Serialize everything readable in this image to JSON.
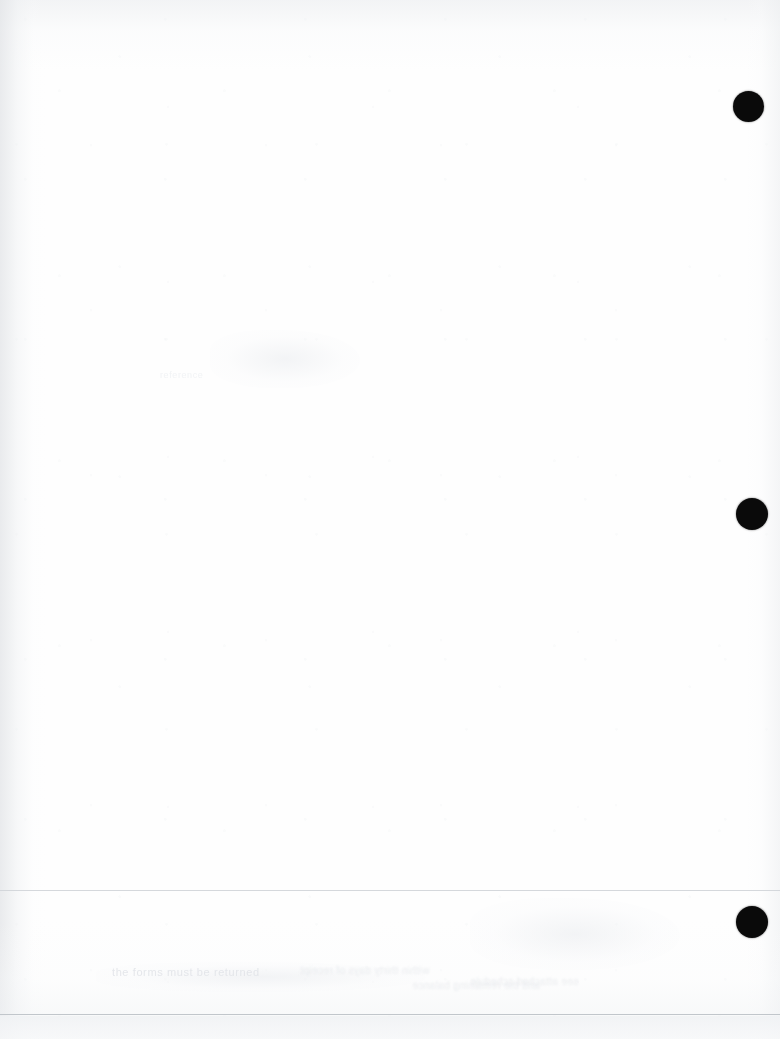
{
  "page": {
    "kind": "scanned-blank-page",
    "width": 780,
    "height": 1039,
    "background_color": "#ffffff",
    "paper_tone": "#fefefe",
    "visible_text": ""
  },
  "punch_holes": {
    "label": "hole-punch-marks",
    "count": 3,
    "color": "#0a0a0a",
    "diameter": 32,
    "marks": [
      {
        "id": "punch-hole-top",
        "cx": 749,
        "cy": 106,
        "d": 31
      },
      {
        "id": "punch-hole-middle",
        "cx": 752,
        "cy": 514,
        "d": 32
      },
      {
        "id": "punch-hole-bottom",
        "cx": 752,
        "cy": 922,
        "d": 32
      }
    ]
  },
  "rules": {
    "label": "horizontal-rules",
    "count": 2,
    "upper": {
      "id": "rule-upper",
      "y": 890,
      "thickness": 1,
      "color": "#d0d4d8"
    },
    "lower": {
      "id": "rule-lower",
      "y": 1014,
      "thickness": 1,
      "color": "#bec3c8"
    }
  },
  "footer_band": {
    "label": "footer-band",
    "y": 1016,
    "height": 23,
    "color": "#f2f3f4"
  },
  "scan_artifacts": {
    "label": "scanner-shading",
    "left_edge_shadow": "#e2e4e7",
    "top_edge_shadow": "#e9ebee",
    "right_edge_shadow": "#eceef0",
    "bottom_edge_shadow": "#eff1f3",
    "grain_color": "#eef0f2",
    "ghosts": [
      {
        "id": "ghost-line-a",
        "x": 112,
        "y": 968,
        "text": "the forms must be returned"
      },
      {
        "id": "ghost-line-b",
        "x": 300,
        "y": 967,
        "text": "within thirty days of receipt"
      },
      {
        "id": "ghost-line-c",
        "x": 470,
        "y": 978,
        "text": "see attached schedule"
      },
      {
        "id": "ghost-line-d",
        "x": 160,
        "y": 372,
        "text": "reference"
      },
      {
        "id": "ghost-line-e",
        "x": 412,
        "y": 982,
        "text": "and the remaining balance"
      }
    ]
  }
}
